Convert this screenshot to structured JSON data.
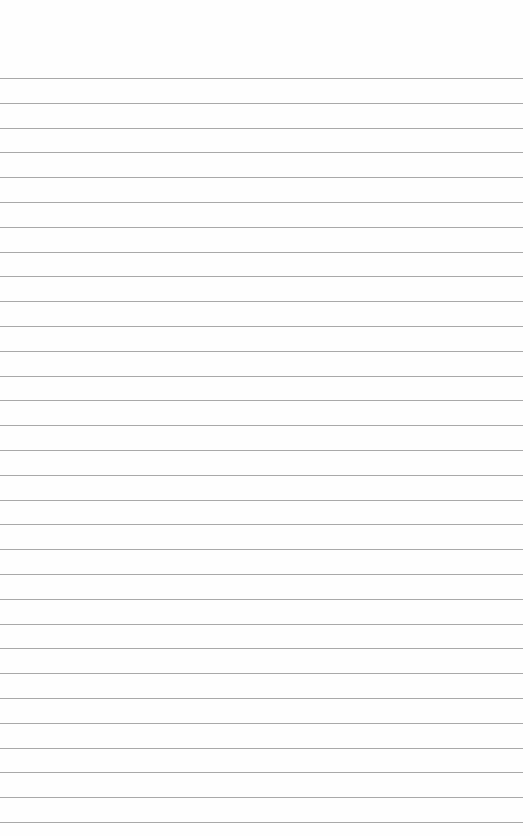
{
  "page": {
    "type": "lined-paper",
    "header_text": "",
    "line_color": "#a9a9a9",
    "background_color": "#fefefe",
    "first_line_y": 78,
    "line_spacing": 24.8,
    "line_count": 31
  }
}
